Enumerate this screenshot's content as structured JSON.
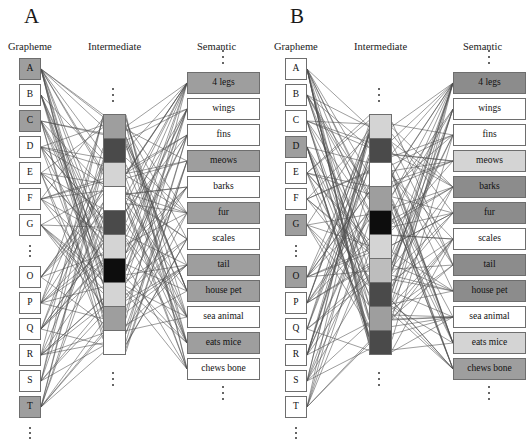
{
  "figure": {
    "type": "neural-network-diagram",
    "background": "#ffffff",
    "panel_count": 2
  },
  "palette": {
    "white": "#ffffff",
    "light_gray": "#d4d4d4",
    "light_medium_gray": "#bdbdbd",
    "medium_gray": "#9e9e9e",
    "gray": "#8c8c8c",
    "dark_gray": "#4a4a4a",
    "black": "#0d0d0d",
    "border": "#6e6e6e",
    "edge": "#4d4d4d",
    "text": "#111111"
  },
  "panels": [
    {
      "id": "A",
      "letter": "A",
      "headers": {
        "grapheme": "Grapheme",
        "intermediate": "Intermediate",
        "semantic": "Semantic"
      },
      "grapheme_units": [
        {
          "label": "A",
          "fill": "#9e9e9e"
        },
        {
          "label": "B",
          "fill": "#ffffff"
        },
        {
          "label": "C",
          "fill": "#9e9e9e"
        },
        {
          "label": "D",
          "fill": "#ffffff"
        },
        {
          "label": "E",
          "fill": "#ffffff"
        },
        {
          "label": "F",
          "fill": "#ffffff"
        },
        {
          "label": "G",
          "fill": "#ffffff"
        },
        {
          "label": "⋮",
          "fill": "ellipsis"
        },
        {
          "label": "O",
          "fill": "#ffffff"
        },
        {
          "label": "P",
          "fill": "#ffffff"
        },
        {
          "label": "Q",
          "fill": "#ffffff"
        },
        {
          "label": "R",
          "fill": "#ffffff"
        },
        {
          "label": "S",
          "fill": "#ffffff"
        },
        {
          "label": "T",
          "fill": "#9e9e9e"
        },
        {
          "label": "⋮",
          "fill": "ellipsis"
        }
      ],
      "intermediate_units": [
        {
          "fill": "#9e9e9e"
        },
        {
          "fill": "#4a4a4a"
        },
        {
          "fill": "#d4d4d4"
        },
        {
          "fill": "#ffffff"
        },
        {
          "fill": "#4a4a4a"
        },
        {
          "fill": "#d4d4d4"
        },
        {
          "fill": "#0d0d0d"
        },
        {
          "fill": "#d4d4d4"
        },
        {
          "fill": "#9e9e9e"
        },
        {
          "fill": "#ffffff"
        }
      ],
      "semantic_units": [
        {
          "label": "4 legs",
          "fill": "#9e9e9e"
        },
        {
          "label": "wings",
          "fill": "#ffffff"
        },
        {
          "label": "fins",
          "fill": "#ffffff"
        },
        {
          "label": "meows",
          "fill": "#9e9e9e"
        },
        {
          "label": "barks",
          "fill": "#ffffff"
        },
        {
          "label": "fur",
          "fill": "#9e9e9e"
        },
        {
          "label": "scales",
          "fill": "#ffffff"
        },
        {
          "label": "tail",
          "fill": "#9e9e9e"
        },
        {
          "label": "house pet",
          "fill": "#9e9e9e"
        },
        {
          "label": "sea animal",
          "fill": "#ffffff"
        },
        {
          "label": "eats mice",
          "fill": "#9e9e9e"
        },
        {
          "label": "chews bone",
          "fill": "#ffffff"
        }
      ]
    },
    {
      "id": "B",
      "letter": "B",
      "headers": {
        "grapheme": "Grapheme",
        "intermediate": "Intermediate",
        "semantic": "Semantic"
      },
      "grapheme_units": [
        {
          "label": "A",
          "fill": "#ffffff"
        },
        {
          "label": "B",
          "fill": "#ffffff"
        },
        {
          "label": "C",
          "fill": "#ffffff"
        },
        {
          "label": "D",
          "fill": "#9e9e9e"
        },
        {
          "label": "E",
          "fill": "#ffffff"
        },
        {
          "label": "F",
          "fill": "#ffffff"
        },
        {
          "label": "G",
          "fill": "#9e9e9e"
        },
        {
          "label": "⋮",
          "fill": "ellipsis"
        },
        {
          "label": "O",
          "fill": "#9e9e9e"
        },
        {
          "label": "P",
          "fill": "#ffffff"
        },
        {
          "label": "Q",
          "fill": "#ffffff"
        },
        {
          "label": "R",
          "fill": "#ffffff"
        },
        {
          "label": "S",
          "fill": "#ffffff"
        },
        {
          "label": "T",
          "fill": "#ffffff"
        },
        {
          "label": "⋮",
          "fill": "ellipsis"
        }
      ],
      "intermediate_units": [
        {
          "fill": "#d4d4d4"
        },
        {
          "fill": "#4a4a4a"
        },
        {
          "fill": "#ffffff"
        },
        {
          "fill": "#9e9e9e"
        },
        {
          "fill": "#0d0d0d"
        },
        {
          "fill": "#d4d4d4"
        },
        {
          "fill": "#bdbdbd"
        },
        {
          "fill": "#4a4a4a"
        },
        {
          "fill": "#9e9e9e"
        },
        {
          "fill": "#4a4a4a"
        }
      ],
      "semantic_units": [
        {
          "label": "4 legs",
          "fill": "#8c8c8c"
        },
        {
          "label": "wings",
          "fill": "#ffffff"
        },
        {
          "label": "fins",
          "fill": "#ffffff"
        },
        {
          "label": "meows",
          "fill": "#d4d4d4"
        },
        {
          "label": "barks",
          "fill": "#8c8c8c"
        },
        {
          "label": "fur",
          "fill": "#8c8c8c"
        },
        {
          "label": "scales",
          "fill": "#ffffff"
        },
        {
          "label": "tail",
          "fill": "#8c8c8c"
        },
        {
          "label": "house pet",
          "fill": "#8c8c8c"
        },
        {
          "label": "sea animal",
          "fill": "#ffffff"
        },
        {
          "label": "eats mice",
          "fill": "#d4d4d4"
        },
        {
          "label": "chews bone",
          "fill": "#9e9e9e"
        }
      ]
    }
  ]
}
